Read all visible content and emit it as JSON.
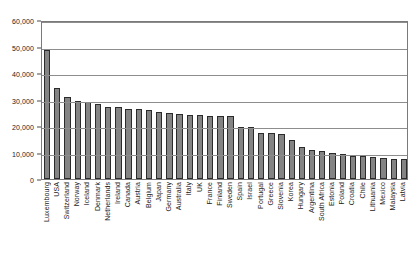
{
  "chart_data": {
    "type": "bar",
    "title": "",
    "subtitle": "",
    "xlabel": "",
    "ylabel": "",
    "ylim": [
      0,
      60000
    ],
    "grid": true,
    "legend": "none",
    "y_ticks": [
      "0",
      "10,000",
      "20,000",
      "30,000",
      "40,000",
      "50,000",
      "60,000"
    ],
    "y_tick_values": [
      0,
      10000,
      20000,
      30000,
      40000,
      50000,
      60000
    ],
    "categories": [
      "Luxembourg",
      "USA",
      "Switzerland",
      "Norway",
      "Iceland",
      "Denmark",
      "Netherlands",
      "Ireland",
      "Canada",
      "Austria",
      "Belgium",
      "Japan",
      "Germany",
      "Australia",
      "Italy",
      "UK",
      "France",
      "Finland",
      "Sweden",
      "Spain",
      "Israel",
      "Portugal",
      "Greece",
      "Slovenia",
      "Korea",
      "Hungary",
      "Argentina",
      "South Africa",
      "Estonia",
      "Poland",
      "Croatia",
      "Chile",
      "Lithuania",
      "Mexico",
      "Malaysia",
      "Latvia"
    ],
    "values": [
      48700,
      34300,
      30800,
      29300,
      28900,
      28400,
      27300,
      27100,
      26400,
      26400,
      26000,
      25300,
      25000,
      24600,
      24300,
      24100,
      23900,
      23800,
      23600,
      19800,
      19700,
      17500,
      17200,
      16900,
      14900,
      12000,
      10900,
      10700,
      9800,
      9400,
      8800,
      8800,
      8200,
      7900,
      7700,
      7600
    ],
    "colors": {
      "bar_fill": "#848484",
      "bar_border": "#2b2b2b",
      "gridline": "#8d8d8d",
      "frame": "#7a7a7a",
      "text": "#1a1a1a",
      "background": "#ffffff"
    }
  }
}
